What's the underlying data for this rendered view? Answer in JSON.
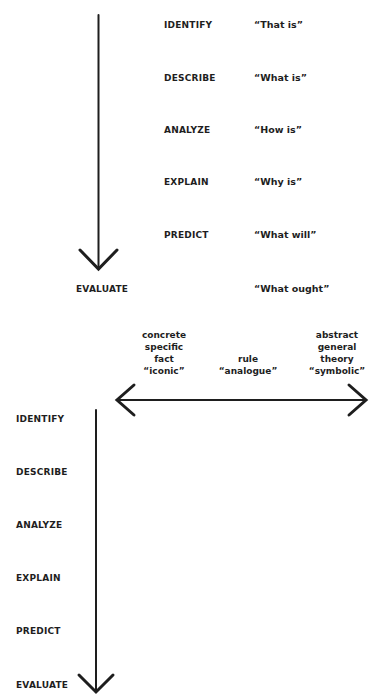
{
  "top_diagram": {
    "levels": [
      {
        "label": "IDENTIFY",
        "quote": "“That is”"
      },
      {
        "label": "DESCRIBE",
        "quote": "“What is”"
      },
      {
        "label": "ANALYZE",
        "quote": "“How is”"
      },
      {
        "label": "EXPLAIN",
        "quote": "“Why is”"
      },
      {
        "label": "PREDICT",
        "quote": "“What will”"
      },
      {
        "label": "EVALUATE",
        "quote": "“What ought”"
      }
    ]
  },
  "continuum": {
    "left": [
      "concrete",
      "specific",
      "fact",
      "“iconic”"
    ],
    "middle": [
      "rule",
      "“analogue”"
    ],
    "right": [
      "abstract",
      "general",
      "theory",
      "“symbolic”"
    ]
  },
  "bottom_diagram": {
    "levels": [
      "IDENTIFY",
      "DESCRIBE",
      "ANALYZE",
      "EXPLAIN",
      "PREDICT",
      "EVALUATE"
    ]
  },
  "colors": {
    "ink": "#1e1e1e",
    "background": "#ffffff"
  }
}
